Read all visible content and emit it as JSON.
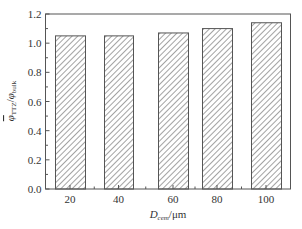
{
  "chart_data": {
    "type": "bar",
    "title": "",
    "categories": [
      "20",
      "40",
      "60",
      "80",
      "100"
    ],
    "values": [
      1.05,
      1.05,
      1.07,
      1.1,
      1.14
    ],
    "xlabel": "D_cem/μm",
    "xlabel_parts": {
      "main": "D",
      "sub": "cem",
      "suffix": "/μm"
    },
    "ylabel": "φ̄_TTZ/φ_bulk",
    "ylabel_parts": {
      "num": "φ",
      "num_sub": "TTZ",
      "sep": "/",
      "den": "φ",
      "den_sub": "bulk"
    },
    "ylim": [
      0,
      1.2
    ],
    "yticks": [
      "0.0",
      "0.2",
      "0.4",
      "0.6",
      "0.8",
      "1.0",
      "1.2"
    ],
    "grid": false,
    "legend": null,
    "bar_fill": "diagonal hatch",
    "colors": {
      "axis": "#555555",
      "hatch": "#555555",
      "bar_edge": "#555555",
      "background": "#ffffff"
    }
  }
}
